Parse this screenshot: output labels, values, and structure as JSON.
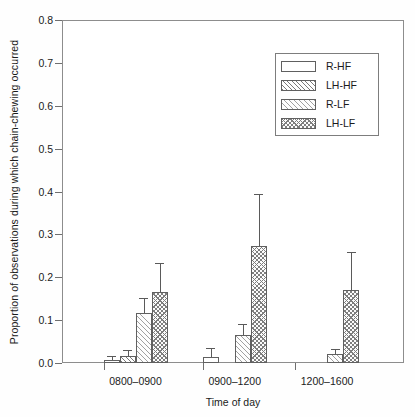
{
  "chart_data": {
    "type": "bar",
    "title": "",
    "xlabel": "Time of day",
    "ylabel": "Proportion of observations during which chain-chewing occurred",
    "ylim": [
      0.0,
      0.8
    ],
    "yticks": [
      "0.0",
      "0.1",
      "0.2",
      "0.3",
      "0.4",
      "0.5",
      "0.6",
      "0.7",
      "0.8"
    ],
    "ytick_values": [
      0.0,
      0.1,
      0.2,
      0.3,
      0.4,
      0.5,
      0.6,
      0.7,
      0.8
    ],
    "grid": false,
    "legend_position": "upper right",
    "categories": [
      "0800–0900",
      "0900–1200",
      "1200–1600"
    ],
    "error_bars": "upper only (SEM)",
    "series": [
      {
        "name": "R-HF",
        "pattern": "none",
        "values": [
          0.008,
          0.015,
          0.0
        ],
        "errors": [
          0.008,
          0.021,
          0.0
        ]
      },
      {
        "name": "LH-HF",
        "pattern": "hatch",
        "values": [
          0.016,
          0.0,
          0.0
        ],
        "errors": [
          0.014,
          0.0,
          0.0
        ]
      },
      {
        "name": "R-LF",
        "pattern": "hatch-light",
        "values": [
          0.116,
          0.065,
          0.022
        ],
        "errors": [
          0.035,
          0.027,
          0.01
        ]
      },
      {
        "name": "LH-LF",
        "pattern": "cross",
        "values": [
          0.166,
          0.274,
          0.17
        ],
        "errors": [
          0.067,
          0.121,
          0.09
        ]
      }
    ]
  },
  "legend": {
    "items": [
      {
        "label": "R-HF",
        "pattern": "none"
      },
      {
        "label": "LH-HF",
        "pattern": "hatch"
      },
      {
        "label": "R-LF",
        "pattern": "hatch-light"
      },
      {
        "label": "LH-LF",
        "pattern": "cross"
      }
    ]
  },
  "colors": {
    "frame": "#8d8d8d",
    "bar_edge": "#606060",
    "hatch": "#7a7a7a",
    "text": "#1b1b1b",
    "background": "#ffffff"
  }
}
